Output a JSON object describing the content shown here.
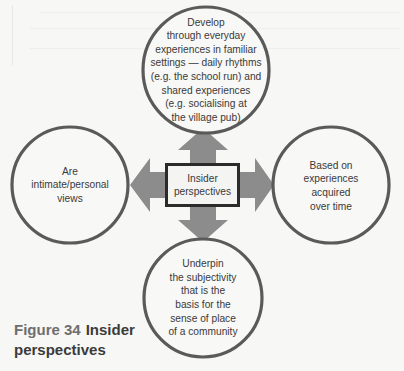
{
  "diagram": {
    "center": {
      "label": "Insider perspectives"
    },
    "nodes": [
      {
        "id": "top",
        "text": "Develop through everyday experiences in familiar settings — daily rhythms (e.g. the school run) and shared experiences (e.g. socialising at the village pub)",
        "lines": [
          "Develop",
          "through everyday",
          "experiences in familiar",
          "settings — daily rhythms",
          "(e.g. the school run) and",
          "shared experiences",
          "(e.g. socialising at",
          "the village pub)"
        ]
      },
      {
        "id": "left",
        "text": "Are intimate/personal views",
        "lines": [
          "Are",
          "intimate/personal",
          "views"
        ]
      },
      {
        "id": "right",
        "text": "Based on experiences acquired over time",
        "lines": [
          "Based on",
          "experiences",
          "acquired",
          "over time"
        ]
      },
      {
        "id": "bottom",
        "text": "Underpin the subjectivity that is the basis for the sense of place of a community",
        "lines": [
          "Underpin",
          "the subjectivity",
          "that is the",
          "basis for the",
          "sense of place",
          "of a community"
        ]
      }
    ],
    "arrows": [
      "up",
      "left",
      "right",
      "down"
    ],
    "colors": {
      "circle_stroke": "#5a5a5a",
      "arrow_fill": "#8c8c8c",
      "box_border": "#2b2b2b",
      "background": "#f7f7f5"
    }
  },
  "caption": {
    "figure_label": "Figure 34",
    "title_line1": "Insider",
    "title_line2": "perspectives"
  }
}
